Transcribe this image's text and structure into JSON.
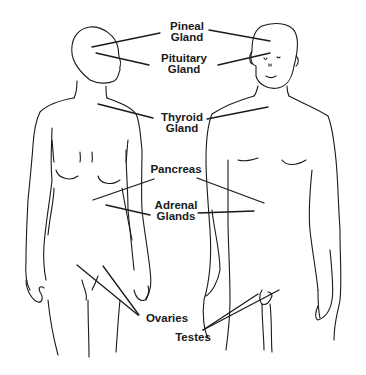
{
  "diagram": {
    "type": "anatomical-line-drawing",
    "figures": [
      {
        "id": "female",
        "view": "front, head turned right"
      },
      {
        "id": "male",
        "view": "front"
      }
    ],
    "colors": {
      "background": "#ffffff",
      "ink": "#1a1a1a"
    },
    "labels": [
      {
        "id": "pineal",
        "line1": "Pineal",
        "line2": "Gland"
      },
      {
        "id": "pituitary",
        "line1": "Pituitary",
        "line2": "Gland"
      },
      {
        "id": "thyroid",
        "line1": "Thyroid",
        "line2": "Gland"
      },
      {
        "id": "pancreas",
        "line1": "Pancreas",
        "line2": ""
      },
      {
        "id": "adrenal",
        "line1": "Adrenal",
        "line2": "Glands"
      },
      {
        "id": "ovaries",
        "line1": "Ovaries",
        "line2": ""
      },
      {
        "id": "testes",
        "line1": "Testes",
        "line2": ""
      }
    ]
  }
}
